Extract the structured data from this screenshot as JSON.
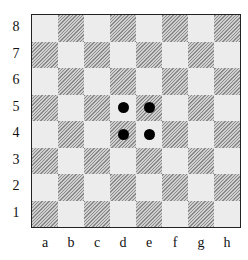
{
  "board": {
    "files": [
      "a",
      "b",
      "c",
      "d",
      "e",
      "f",
      "g",
      "h"
    ],
    "ranks": [
      "8",
      "7",
      "6",
      "5",
      "4",
      "3",
      "2",
      "1"
    ],
    "colors": {
      "light_square": "#ececec",
      "dark_square_hatch": "#8a8a8a",
      "piece": "#000000",
      "border": "#222222"
    },
    "pieces": [
      {
        "square": "d5",
        "type": "disc",
        "color": "black"
      },
      {
        "square": "e5",
        "type": "disc",
        "color": "black"
      },
      {
        "square": "d4",
        "type": "disc",
        "color": "black"
      },
      {
        "square": "e4",
        "type": "disc",
        "color": "black"
      }
    ]
  }
}
